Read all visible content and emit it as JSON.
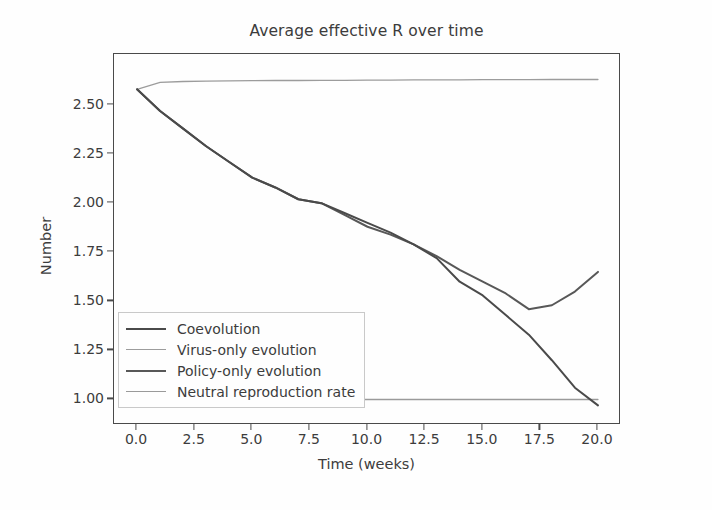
{
  "chart_data": {
    "type": "line",
    "title": "Average effective R over time",
    "xlabel": "Time (weeks)",
    "ylabel": "Number",
    "xlim": [
      -1.0,
      21.0
    ],
    "ylim": [
      0.87,
      2.76
    ],
    "xticks": [
      "0.0",
      "2.5",
      "5.0",
      "7.5",
      "10.0",
      "12.5",
      "15.0",
      "17.5",
      "20.0"
    ],
    "xtick_values": [
      0.0,
      2.5,
      5.0,
      7.5,
      10.0,
      12.5,
      15.0,
      17.5,
      20.0
    ],
    "yticks": [
      "1.00",
      "1.25",
      "1.50",
      "1.75",
      "2.00",
      "2.25",
      "2.50"
    ],
    "ytick_values": [
      1.0,
      1.25,
      1.5,
      1.75,
      2.0,
      2.25,
      2.5
    ],
    "grid": false,
    "legend_position": "lower left",
    "x": [
      0,
      1,
      2,
      3,
      4,
      5,
      6,
      7,
      8,
      9,
      10,
      11,
      12,
      13,
      14,
      15,
      16,
      17,
      18,
      19,
      20
    ],
    "series": [
      {
        "name": "Coevolution",
        "color": "#4a4a4a",
        "width": 2.0,
        "values": [
          2.58,
          2.47,
          2.38,
          2.29,
          2.21,
          2.13,
          2.08,
          2.02,
          2.0,
          1.95,
          1.9,
          1.85,
          1.79,
          1.72,
          1.6,
          1.53,
          1.43,
          1.33,
          1.2,
          1.06,
          0.97
        ]
      },
      {
        "name": "Virus-only evolution",
        "color": "#9c9c9c",
        "width": 1.3,
        "values": [
          2.58,
          2.615,
          2.62,
          2.622,
          2.623,
          2.624,
          2.625,
          2.625,
          2.626,
          2.626,
          2.627,
          2.627,
          2.628,
          2.628,
          2.628,
          2.629,
          2.629,
          2.629,
          2.63,
          2.63,
          2.63
        ]
      },
      {
        "name": "Policy-only evolution",
        "color": "#585858",
        "width": 2.0,
        "values": [
          2.58,
          2.47,
          2.38,
          2.29,
          2.21,
          2.13,
          2.08,
          2.02,
          2.0,
          1.94,
          1.88,
          1.84,
          1.79,
          1.73,
          1.66,
          1.6,
          1.54,
          1.46,
          1.48,
          1.55,
          1.65
        ]
      },
      {
        "name": "Neutral reproduction rate",
        "color": "#9a9a9a",
        "width": 1.3,
        "values": [
          1.0,
          1.0,
          1.0,
          1.0,
          1.0,
          1.0,
          1.0,
          1.0,
          1.0,
          1.0,
          1.0,
          1.0,
          1.0,
          1.0,
          1.0,
          1.0,
          1.0,
          1.0,
          1.0,
          1.0,
          1.0
        ]
      }
    ]
  }
}
